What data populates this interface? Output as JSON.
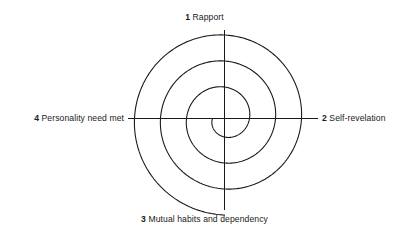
{
  "diagram": {
    "type": "spiral-quadrant-diagram",
    "title": "",
    "background_color": "#ffffff",
    "line_color": "#1a1a1a",
    "center": {
      "x": 224,
      "y": 118
    },
    "spiral": {
      "turns": 3,
      "start_radius": 12,
      "growth_per_turn": 26,
      "axis_crossings_left": [
        146,
        172,
        196,
        212
      ],
      "axis_crossings_right": [
        238,
        264,
        292
      ],
      "top_extent_y": 40,
      "bottom_extent_y": 203
    },
    "axes": {
      "horizontal": {
        "x1": 128,
        "x2": 318,
        "y": 118
      },
      "vertical": {
        "y1": 30,
        "y2": 210,
        "x": 224
      }
    },
    "labels": {
      "top": {
        "number": "1",
        "text": "Rapport"
      },
      "right": {
        "number": "2",
        "text": "Self-revelation"
      },
      "bottom": {
        "number": "3",
        "text": "Mutual habits and dependency"
      },
      "left": {
        "number": "4",
        "text": "Personality need met"
      }
    }
  }
}
